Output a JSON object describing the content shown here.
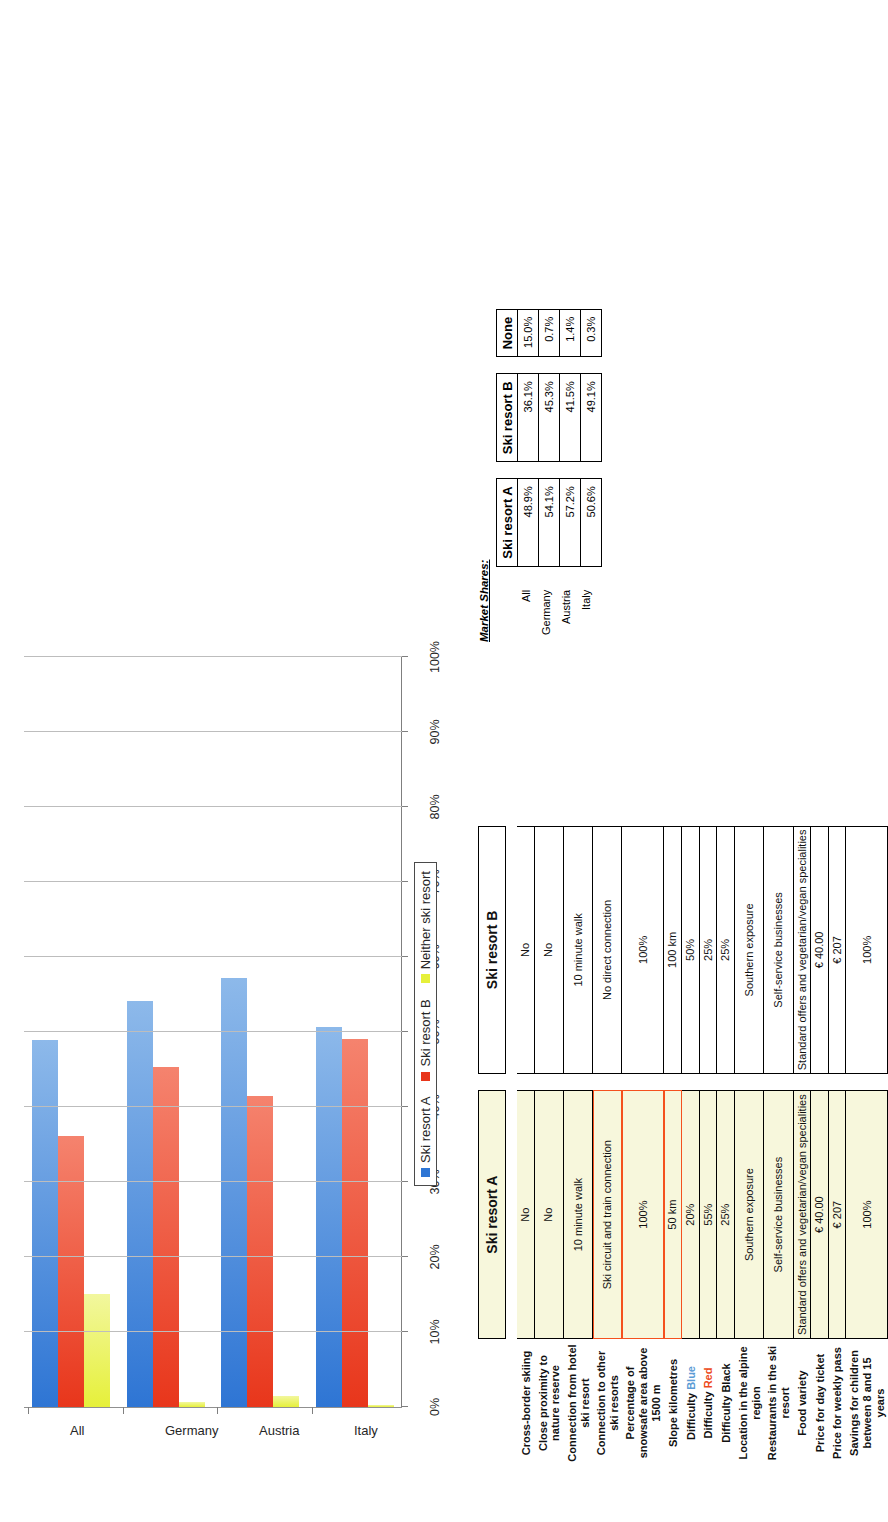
{
  "chart_data": {
    "type": "bar",
    "orientation": "horizontal",
    "title": "",
    "xlabel": "",
    "ylabel": "",
    "categories": [
      "All",
      "Germany",
      "Austria",
      "Italy"
    ],
    "series": [
      {
        "name": "Ski resort A",
        "color": "#2e75d4",
        "values": [
          48.9,
          54.1,
          57.2,
          50.6
        ]
      },
      {
        "name": "Ski resort B",
        "color": "#e8361b",
        "values": [
          36.1,
          45.3,
          41.5,
          49.1
        ]
      },
      {
        "name": "Neither ski resort",
        "color": "#e6f03a",
        "values": [
          15.0,
          0.7,
          1.4,
          0.3
        ]
      }
    ],
    "axis_ticks": [
      "0%",
      "10%",
      "20%",
      "30%",
      "40%",
      "50%",
      "60%",
      "70%",
      "80%",
      "90%",
      "100%"
    ],
    "axis_min": 0,
    "axis_max": 100,
    "grid": true,
    "legend_position": "bottom",
    "legend": [
      "Ski resort A",
      "Ski resort B",
      "Neither ski resort"
    ]
  },
  "comparison_table": {
    "col_headers": [
      "Ski resort A",
      "Ski resort B"
    ],
    "rows": [
      {
        "label": "Cross-border skiing",
        "a": "No",
        "b": "No",
        "hl_a": false
      },
      {
        "label": "Close proximity to nature reserve",
        "a": "No",
        "b": "No",
        "hl_a": false
      },
      {
        "label": "Connection from hotel ski resort",
        "a": "10 minute walk",
        "b": "10 minute walk",
        "hl_a": false
      },
      {
        "label": "Connection to other ski resorts",
        "a": "Ski circuit and train connection",
        "b": "No direct connection",
        "hl_a": true
      },
      {
        "label": "Percentage of snowsafe area above 1500 m",
        "a": "100%",
        "b": "100%",
        "hl_a": true
      },
      {
        "label": "Slope kilometres",
        "a": "50 km",
        "b": "100 km",
        "hl_a": true
      },
      {
        "label_pre": "Difficulty ",
        "label_color": "Blue",
        "label_color_class": "dif-blue",
        "a": "20%",
        "b": "50%",
        "hl_a": false
      },
      {
        "label_pre": "Difficulty ",
        "label_color": "Red",
        "label_color_class": "dif-red",
        "a": "55%",
        "b": "25%",
        "hl_a": false
      },
      {
        "label": "Difficulty Black",
        "a": "25%",
        "b": "25%",
        "hl_a": false
      },
      {
        "label": "Location in the alpine region",
        "a": "Southern exposure",
        "b": "Southern exposure",
        "hl_a": false
      },
      {
        "label": "Restaurants in the ski resort",
        "a": "Self-service businesses",
        "b": "Self-service businesses",
        "hl_a": false
      },
      {
        "label": "Food variety",
        "a": "Standard offers and vegetarian/vegan specialities",
        "b": "Standard offers and vegetarian/vegan specialities",
        "hl_a": false
      },
      {
        "label": "Price for day ticket",
        "a": "€ 40.00",
        "b": "€ 40.00",
        "hl_a": false
      },
      {
        "label": "Price for weekly pass",
        "a": "€ 207",
        "b": "€ 207",
        "hl_a": false
      },
      {
        "label": "Savings for children between 8 and 15 years",
        "a": "100%",
        "b": "100%",
        "hl_a": false
      }
    ]
  },
  "market_shares": {
    "title": "Market Shares:",
    "row_labels": [
      "All",
      "Germany",
      "Austria",
      "Italy"
    ],
    "tables": [
      {
        "header": "Ski resort A",
        "values": [
          "48.9%",
          "54.1%",
          "57.2%",
          "50.6%"
        ]
      },
      {
        "header": "Ski resort B",
        "values": [
          "36.1%",
          "45.3%",
          "41.5%",
          "49.1%"
        ]
      },
      {
        "header": "None",
        "values": [
          "15.0%",
          "0.7%",
          "1.4%",
          "0.3%"
        ]
      }
    ]
  },
  "colors": {
    "series_a": "#2e75d4",
    "series_b": "#e8361b",
    "series_none": "#e6f03a",
    "highlight": "#f4511e",
    "col_a_fill": "#f7f7dc"
  }
}
